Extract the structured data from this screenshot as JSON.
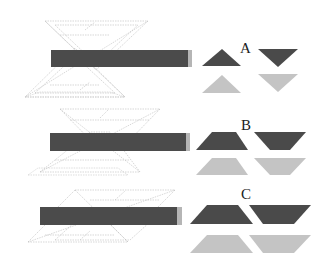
{
  "figure": {
    "panels": [
      {
        "id": "A",
        "label": "A",
        "shape": "triangle"
      },
      {
        "id": "B",
        "label": "B",
        "shape": "trapezoid"
      },
      {
        "id": "C",
        "label": "C",
        "shape": "parallelogram"
      }
    ],
    "colors": {
      "bar": "#4a4a4a",
      "bar_cap": "#b0b0b0",
      "dark_shape": "#4a4a4a",
      "light_shape": "#c4c4c4",
      "wireframe": "#b8b8b8"
    }
  }
}
